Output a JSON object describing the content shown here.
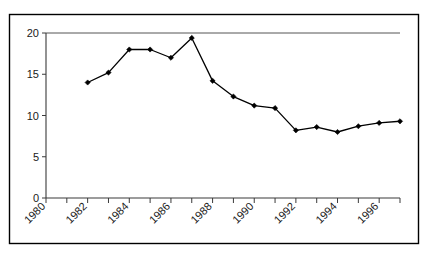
{
  "chart_data": {
    "type": "line",
    "title": "",
    "subtitle": "",
    "xlabel": "",
    "ylabel": "",
    "x": [
      1982,
      1983,
      1984,
      1985,
      1986,
      1987,
      1988,
      1989,
      1990,
      1991,
      1992,
      1993,
      1994,
      1995,
      1996,
      1997
    ],
    "values": [
      14.0,
      15.2,
      18.0,
      18.0,
      17.0,
      19.4,
      14.2,
      12.3,
      11.2,
      10.9,
      8.2,
      8.6,
      8.0,
      8.7,
      9.1,
      9.3
    ],
    "series": [
      {
        "name": "series-1",
        "values": [
          14.0,
          15.2,
          18.0,
          18.0,
          17.0,
          19.4,
          14.2,
          12.3,
          11.2,
          10.9,
          8.2,
          8.6,
          8.0,
          8.7,
          9.1,
          9.3
        ]
      }
    ],
    "xlim": [
      1980,
      1997
    ],
    "ylim": [
      0,
      20
    ],
    "y_ticks": [
      0,
      5,
      10,
      15,
      20
    ],
    "y_tick_labels": [
      "0",
      "5",
      "10",
      "15",
      "20"
    ],
    "x_ticks": [
      1980,
      1981,
      1982,
      1983,
      1984,
      1985,
      1986,
      1987,
      1988,
      1989,
      1990,
      1991,
      1992,
      1993,
      1994,
      1995,
      1996,
      1997
    ],
    "x_tick_labels": [
      "1980",
      "1982",
      "1984",
      "1986",
      "1988",
      "1990",
      "1992",
      "1994",
      "1996"
    ],
    "x_tick_label_values": [
      1980,
      1982,
      1984,
      1986,
      1988,
      1990,
      1992,
      1994,
      1996
    ],
    "x_tick_label_rotation": -45,
    "grid": false,
    "legend": false,
    "legend_position": "none",
    "marker": "diamond",
    "line_color": "#000000",
    "marker_color": "#000000",
    "background_color": "#ffffff",
    "border_color": "#000000"
  },
  "figure": {
    "border_visible": true,
    "plot_background": "#ffffff"
  }
}
